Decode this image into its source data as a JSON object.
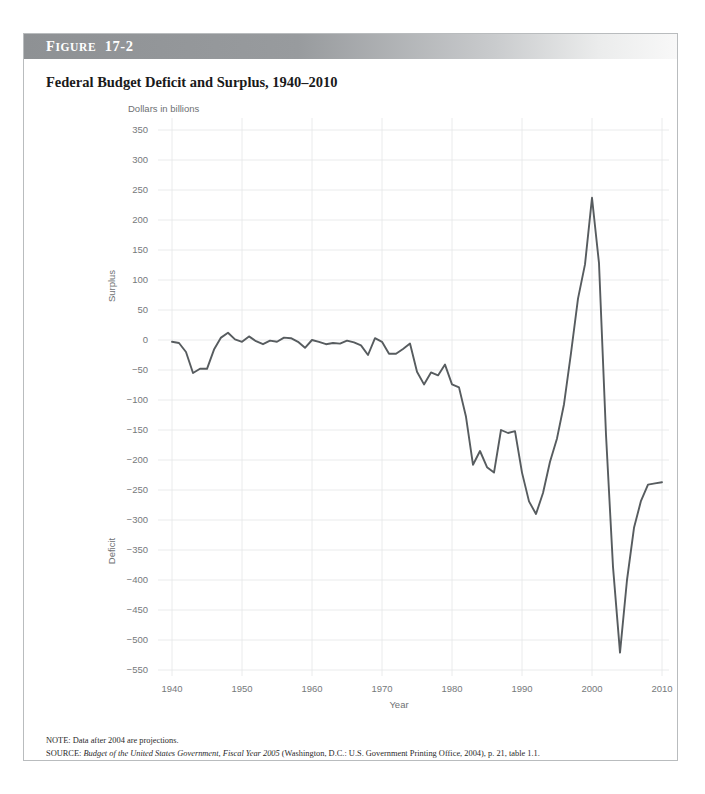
{
  "figure": {
    "number_prefix": "F",
    "number_rest": "IGURE",
    "number_value": "17-2",
    "title": "Federal Budget Deficit and Surplus, 1940–2010",
    "note": "NOTE: Data after 2004 are projections.",
    "source_prefix": "SOURCE: ",
    "source_italic": "Budget of the United States Government, Fiscal Year 2005",
    "source_rest": " (Washington, D.C.: U.S. Government Printing Office, 2004), p. 21, table 1.1."
  },
  "chart_data": {
    "type": "line",
    "title": "Federal Budget Deficit and Surplus, 1940–2010",
    "xlabel": "Year",
    "ylabel": "Dollars in billions",
    "ylabel_positive_region": "Surplus",
    "ylabel_negative_region": "Deficit",
    "xlim": [
      1938,
      2011
    ],
    "ylim": [
      -560,
      370
    ],
    "xticks": [
      1940,
      1950,
      1960,
      1970,
      1980,
      1990,
      2000,
      2010
    ],
    "yticks": [
      350,
      300,
      250,
      200,
      150,
      100,
      50,
      0,
      -50,
      -100,
      -150,
      -200,
      -250,
      -300,
      -350,
      -400,
      -450,
      -500,
      -550
    ],
    "ytick_labels": [
      "350",
      "300",
      "250",
      "200",
      "150",
      "100",
      "50",
      "0",
      "−50",
      "−100",
      "−150",
      "−200",
      "−250",
      "−300",
      "−350",
      "−400",
      "−450",
      "−500",
      "−550"
    ],
    "xtick_labels": [
      "1940",
      "1950",
      "1960",
      "1970",
      "1980",
      "1990",
      "2000",
      "2010"
    ],
    "grid": true,
    "legend": "none",
    "line_color": "#575c5f",
    "series": [
      {
        "name": "Federal budget surplus/deficit",
        "x": [
          1940,
          1941,
          1942,
          1943,
          1944,
          1945,
          1946,
          1947,
          1948,
          1949,
          1950,
          1951,
          1952,
          1953,
          1954,
          1955,
          1956,
          1957,
          1958,
          1959,
          1960,
          1961,
          1962,
          1963,
          1964,
          1965,
          1966,
          1967,
          1968,
          1969,
          1970,
          1971,
          1972,
          1973,
          1974,
          1975,
          1976,
          1977,
          1978,
          1979,
          1980,
          1981,
          1982,
          1983,
          1984,
          1985,
          1986,
          1987,
          1988,
          1989,
          1990,
          1991,
          1992,
          1993,
          1994,
          1995,
          1996,
          1997,
          1998,
          1999,
          2000,
          2001,
          2002,
          2003,
          2004,
          2005,
          2006,
          2007,
          2008,
          2009,
          2010
        ],
        "values": [
          -3,
          -5,
          -20,
          -55,
          -48,
          -48,
          -16,
          4,
          12,
          1,
          -3,
          6,
          -2,
          -7,
          -1,
          -3,
          4,
          3,
          -3,
          -13,
          0,
          -3,
          -7,
          -5,
          -6,
          -1,
          -4,
          -9,
          -25,
          3,
          -3,
          -23,
          -23,
          -15,
          -6,
          -53,
          -74,
          -54,
          -59,
          -41,
          -74,
          -79,
          -128,
          -208,
          -185,
          -212,
          -221,
          -150,
          -155,
          -152,
          -221,
          -269,
          -290,
          -255,
          -203,
          -164,
          -107,
          -22,
          69,
          126,
          237,
          128,
          -158,
          -378,
          -521,
          -400,
          -313,
          -268,
          -241,
          -239,
          -237
        ]
      }
    ]
  }
}
